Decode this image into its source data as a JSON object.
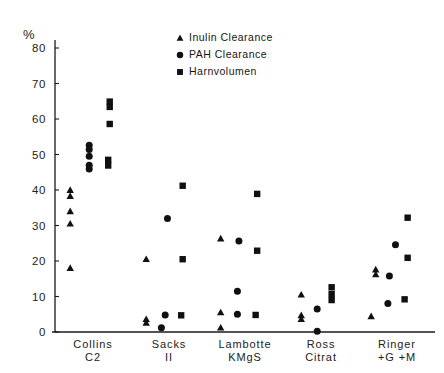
{
  "chart_data": {
    "type": "scatter",
    "title": "",
    "subtitle": "",
    "ylabel": "%",
    "xlabel": "",
    "ylim": [
      0,
      80
    ],
    "yticks": [
      0,
      10,
      20,
      30,
      40,
      50,
      60,
      70,
      80
    ],
    "ytick_labels": [
      "0",
      "10",
      "20",
      "30",
      "40",
      "50",
      "60",
      "70",
      "80"
    ],
    "grid": false,
    "legend_position": "top-center-right",
    "categories": [
      "Collins C2",
      "Sacks II",
      "Lambotte KMgS",
      "Ross Citrat",
      "Ringer +G +M"
    ],
    "category_labels": [
      {
        "line1": "Collins",
        "line2": "C2"
      },
      {
        "line1": "Sacks",
        "line2": "II"
      },
      {
        "line1": "Lambotte",
        "line2": "KMgS"
      },
      {
        "line1": "Ross",
        "line2": "Citrat"
      },
      {
        "line1": "Ringer",
        "line2": "+G +M"
      }
    ],
    "legend": [
      {
        "marker": "triangle",
        "label": "Inulin Clearance"
      },
      {
        "marker": "circle",
        "label": "PAH  Clearance"
      },
      {
        "marker": "square",
        "label": "Harnvolumen"
      }
    ],
    "series": [
      {
        "name": "Inulin Clearance",
        "marker": "triangle",
        "points": [
          {
            "category": "Collins C2",
            "offset": -0.3,
            "value": 40.0
          },
          {
            "category": "Collins C2",
            "offset": -0.3,
            "value": 38.3
          },
          {
            "category": "Collins C2",
            "offset": -0.3,
            "value": 34.0
          },
          {
            "category": "Collins C2",
            "offset": -0.3,
            "value": 30.5
          },
          {
            "category": "Collins C2",
            "offset": -0.3,
            "value": 18.0
          },
          {
            "category": "Sacks II",
            "offset": -0.3,
            "value": 20.5
          },
          {
            "category": "Sacks II",
            "offset": -0.3,
            "value": 3.6
          },
          {
            "category": "Sacks II",
            "offset": -0.3,
            "value": 2.6
          },
          {
            "category": "Lambotte KMgS",
            "offset": -0.32,
            "value": 26.3
          },
          {
            "category": "Lambotte KMgS",
            "offset": -0.32,
            "value": 5.5
          },
          {
            "category": "Lambotte KMgS",
            "offset": -0.32,
            "value": 1.2
          },
          {
            "category": "Ross Citrat",
            "offset": -0.26,
            "value": 10.5
          },
          {
            "category": "Ross Citrat",
            "offset": -0.26,
            "value": 4.7
          },
          {
            "category": "Ross Citrat",
            "offset": -0.26,
            "value": 3.6
          },
          {
            "category": "Ringer +G +M",
            "offset": -0.28,
            "value": 17.6
          },
          {
            "category": "Ringer +G +M",
            "offset": -0.28,
            "value": 16.2
          },
          {
            "category": "Ringer +G +M",
            "offset": -0.34,
            "value": 4.4
          }
        ]
      },
      {
        "name": "PAH Clearance",
        "marker": "circle",
        "points": [
          {
            "category": "Collins C2",
            "offset": -0.05,
            "value": 52.6
          },
          {
            "category": "Collins C2",
            "offset": -0.05,
            "value": 51.4
          },
          {
            "category": "Collins C2",
            "offset": -0.05,
            "value": 49.5
          },
          {
            "category": "Collins C2",
            "offset": -0.05,
            "value": 47.0
          },
          {
            "category": "Collins C2",
            "offset": -0.05,
            "value": 45.9
          },
          {
            "category": "Sacks II",
            "offset": -0.02,
            "value": 32.0
          },
          {
            "category": "Sacks II",
            "offset": -0.05,
            "value": 4.8
          },
          {
            "category": "Sacks II",
            "offset": -0.1,
            "value": 1.2
          },
          {
            "category": "Lambotte KMgS",
            "offset": -0.08,
            "value": 25.6
          },
          {
            "category": "Lambotte KMgS",
            "offset": -0.1,
            "value": 11.5
          },
          {
            "category": "Lambotte KMgS",
            "offset": -0.1,
            "value": 5.0
          },
          {
            "category": "Ross Citrat",
            "offset": -0.05,
            "value": 6.5
          },
          {
            "category": "Ross Citrat",
            "offset": -0.05,
            "value": 0.2
          },
          {
            "category": "Ringer +G +M",
            "offset": -0.02,
            "value": 24.6
          },
          {
            "category": "Ringer +G +M",
            "offset": -0.1,
            "value": 15.8
          },
          {
            "category": "Ringer +G +M",
            "offset": -0.12,
            "value": 8.0
          }
        ]
      },
      {
        "name": "Harnvolumen",
        "marker": "square",
        "points": [
          {
            "category": "Collins C2",
            "offset": 0.22,
            "value": 64.9
          },
          {
            "category": "Collins C2",
            "offset": 0.22,
            "value": 63.4
          },
          {
            "category": "Collins C2",
            "offset": 0.22,
            "value": 58.6
          },
          {
            "category": "Collins C2",
            "offset": 0.2,
            "value": 48.5
          },
          {
            "category": "Collins C2",
            "offset": 0.2,
            "value": 46.9
          },
          {
            "category": "Sacks II",
            "offset": 0.18,
            "value": 41.2
          },
          {
            "category": "Sacks II",
            "offset": 0.18,
            "value": 20.5
          },
          {
            "category": "Sacks II",
            "offset": 0.16,
            "value": 4.7
          },
          {
            "category": "Lambotte KMgS",
            "offset": 0.16,
            "value": 38.9
          },
          {
            "category": "Lambotte KMgS",
            "offset": 0.16,
            "value": 22.9
          },
          {
            "category": "Lambotte KMgS",
            "offset": 0.14,
            "value": 4.8
          },
          {
            "category": "Ross Citrat",
            "offset": 0.14,
            "value": 12.6
          },
          {
            "category": "Ross Citrat",
            "offset": 0.14,
            "value": 10.7
          },
          {
            "category": "Ross Citrat",
            "offset": 0.14,
            "value": 9.0
          },
          {
            "category": "Ringer +G +M",
            "offset": 0.14,
            "value": 32.2
          },
          {
            "category": "Ringer +G +M",
            "offset": 0.14,
            "value": 20.9
          },
          {
            "category": "Ringer +G +M",
            "offset": 0.1,
            "value": 9.2
          }
        ]
      }
    ]
  },
  "colors": {
    "marker": "#101010",
    "axis": "#1a1a1a",
    "text": "#222222",
    "background": "#ffffff"
  }
}
